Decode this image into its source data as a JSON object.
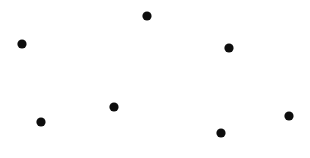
{
  "canvas": {
    "width": 310,
    "height": 158,
    "background_color": "#ffffff"
  },
  "chart_data": {
    "type": "scatter",
    "title": "",
    "subtitle": "",
    "xlabel": "",
    "ylabel": "",
    "grid": false,
    "legend": false,
    "axes_visible": false,
    "tick_labels_x": [],
    "tick_labels_y": [],
    "annotations": [],
    "xlim": [
      0,
      310
    ],
    "ylim": [
      0,
      158
    ],
    "marker": {
      "shape": "circle",
      "color": "#0d0d0d",
      "radius": 4.6
    },
    "series": [
      {
        "name": "points",
        "color": "#0d0d0d",
        "points": [
          {
            "x": 147,
            "y": 16
          },
          {
            "x": 22,
            "y": 44
          },
          {
            "x": 229,
            "y": 48
          },
          {
            "x": 114,
            "y": 107
          },
          {
            "x": 289,
            "y": 116
          },
          {
            "x": 41,
            "y": 122
          },
          {
            "x": 221,
            "y": 133
          }
        ]
      }
    ]
  }
}
